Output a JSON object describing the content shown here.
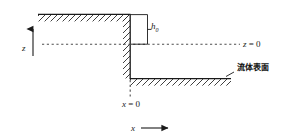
{
  "figure": {
    "labels": {
      "z_axis": "z",
      "x_axis": "x",
      "step_height": "h",
      "step_height_sub": "0",
      "z_zero_var": "z",
      "z_zero_eq": " = 0",
      "x_zero_var": "x",
      "x_zero_eq": " = 0",
      "fluid_surface": "流体表面"
    },
    "colors": {
      "line": "#1a1a1a",
      "hatch": "#2b2b2b",
      "dotted": "#4d4d4d",
      "background": "#ffffff"
    },
    "geometry": {
      "upper_wall_y": 14,
      "upper_wall_x_start": 38,
      "upper_wall_x_end": 130,
      "vertical_wall_x": 130,
      "vertical_wall_y_top": 14,
      "vertical_wall_y_bottom": 78,
      "lower_wall_y": 78,
      "lower_wall_x_start": 130,
      "lower_wall_x_end": 231,
      "z_zero_line_y": 44,
      "x_zero_line_x": 130,
      "step_height_value": 30
    }
  }
}
